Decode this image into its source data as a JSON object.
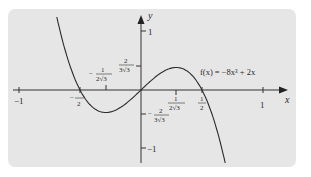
{
  "chart_data": {
    "type": "line",
    "title": "",
    "function_label": "f(x) = −8x³ + 2x",
    "xlabel": "x",
    "ylabel": "y",
    "xlim": [
      -1.1,
      1.15
    ],
    "ylim": [
      -1.3,
      1.45
    ],
    "grid": false,
    "legend": null,
    "x_ticks": [
      {
        "value": -1,
        "label": "−1"
      },
      {
        "value": -0.5,
        "label_num": "1",
        "label_den": "2",
        "sign": "−"
      },
      {
        "value": -0.2887,
        "label_num": "1",
        "label_den": "2√3",
        "sign": "−"
      },
      {
        "value": 0.2887,
        "label_num": "1",
        "label_den": "2√3",
        "sign": ""
      },
      {
        "value": 0.5,
        "label_num": "1",
        "label_den": "2",
        "sign": ""
      },
      {
        "value": 1,
        "label": "1"
      }
    ],
    "y_ticks": [
      {
        "value": 1,
        "label": "1"
      },
      {
        "value": 0.3849,
        "label_num": "2",
        "label_den": "3√3",
        "sign": ""
      },
      {
        "value": -0.3849,
        "label_num": "2",
        "label_den": "3√3",
        "sign": "−"
      },
      {
        "value": -1,
        "label": "−1"
      }
    ],
    "series": [
      {
        "name": "f(x) = −8x³ + 2x",
        "x": [
          -0.7,
          -0.65,
          -0.6,
          -0.55,
          -0.5,
          -0.45,
          -0.4,
          -0.35,
          -0.2887,
          -0.25,
          -0.2,
          -0.15,
          -0.1,
          -0.05,
          0,
          0.05,
          0.1,
          0.15,
          0.2,
          0.25,
          0.2887,
          0.35,
          0.4,
          0.45,
          0.5,
          0.55,
          0.6,
          0.65,
          0.7
        ],
        "y": [
          1.344,
          0.897,
          0.528,
          0.231,
          0.0,
          -0.171,
          -0.288,
          -0.357,
          -0.3849,
          -0.375,
          -0.336,
          -0.273,
          -0.192,
          -0.099,
          0,
          0.099,
          0.192,
          0.273,
          0.336,
          0.375,
          0.3849,
          0.357,
          0.288,
          0.171,
          0.0,
          -0.231,
          -0.528,
          -0.897,
          -1.344
        ]
      }
    ]
  },
  "labels": {
    "function": "f(x) = −8x³ + 2x",
    "x_axis": "x",
    "y_axis": "y",
    "x_neg1": "−1",
    "x_pos1": "1",
    "y_pos1": "1",
    "y_neg1": "−1",
    "one": "1",
    "two": "2",
    "den_2": "2",
    "den_2r3": "2√3",
    "den_3r3": "3√3",
    "minus": "−"
  }
}
